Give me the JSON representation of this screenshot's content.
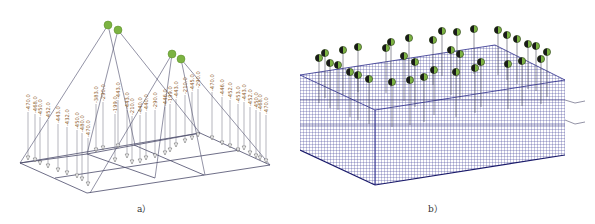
{
  "figure": {
    "panels": [
      {
        "id": "a",
        "caption": "a）",
        "description": "Lifting point layout with cable members and nodal loads",
        "hook_color": "#7cb342",
        "line_color": "#4a4a6a",
        "label_color": "#8a5a2a",
        "load_labels": [
          "-470.0",
          "-468.0",
          "-450.0",
          "-452.0",
          "-443.0",
          "-432.0",
          "-450.0",
          "-480.0",
          "-470.0",
          "-383.0",
          "-290.0",
          "-443.0",
          "-199.0",
          "-443.0",
          "-210.0",
          "-440.0",
          "-440.0",
          "-290.0",
          "-446.0",
          "-199.0",
          "-443.0",
          "-210.0",
          "-445.0",
          "-290.0",
          "-470.0",
          "-446.0",
          "-452.0",
          "-453.0",
          "-443.0",
          "-452.0",
          "-450.0",
          "-468.0",
          "-470.0"
        ]
      },
      {
        "id": "b",
        "caption": "b）",
        "description": "3D rebar cage wireframe with lifting points",
        "mesh_color": "#2a2a8a",
        "hook_color": "#7cb342"
      }
    ]
  }
}
